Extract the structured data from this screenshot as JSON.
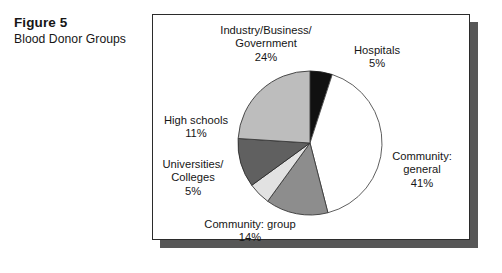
{
  "caption": {
    "figure_number": "Figure 5",
    "title": "Blood Donor Groups"
  },
  "chart_data": {
    "type": "pie",
    "title": "Blood Donor Groups",
    "units": "percent",
    "legend": "none-labels-on-slices",
    "start_angle_deg": 0,
    "direction": "clockwise",
    "categories": [
      "Hospitals",
      "Community: general",
      "Community: group",
      "Universities/Colleges",
      "High schools",
      "Industry/Business/Government"
    ],
    "values": [
      5,
      41,
      14,
      5,
      11,
      24
    ],
    "total": 100,
    "slices": [
      {
        "name": "Hospitals",
        "value": 5,
        "label_line1": "Hospitals",
        "label_line2": "5%",
        "color": "#111111",
        "stroke": "#1a1a1a"
      },
      {
        "name": "Community: general",
        "value": 41,
        "label_line1": "Community:",
        "label_line2": "general",
        "label_line3": "41%",
        "color": "#ffffff",
        "stroke": "#4d4d4d"
      },
      {
        "name": "Community: group",
        "value": 14,
        "label_line1": "Community: group",
        "label_line2": "14%",
        "color": "#8d8d8d",
        "stroke": "#3a3a3a"
      },
      {
        "name": "Universities/Colleges",
        "value": 5,
        "label_line1": "Universities/",
        "label_line2": "Colleges",
        "label_line3": "5%",
        "color": "#e2e2e2",
        "stroke": "#3a3a3a"
      },
      {
        "name": "High schools",
        "value": 11,
        "label_line1": "High schools",
        "label_line2": "11%",
        "color": "#606060",
        "stroke": "#2b2b2b"
      },
      {
        "name": "Industry/Business/Government",
        "value": 24,
        "label_line1": "Industry/Business/",
        "label_line2": "Government",
        "label_line3": "24%",
        "color": "#bdbdbd",
        "stroke": "#3a3a3a"
      }
    ],
    "geometry": {
      "center_x": 310,
      "center_y": 143,
      "radius": 72
    }
  },
  "labels": {
    "industry": "Industry/Business/\nGovernment\n24%",
    "hospitals": "Hospitals\n5%",
    "community_general": "Community:\ngeneral\n41%",
    "high_schools": "High schools\n11%",
    "universities": "Universities/\nColleges\n5%",
    "community_group": "Community: group\n14%"
  },
  "colors": {
    "panel_border": "#2b2b2b",
    "panel_shadow": "#575757",
    "text": "#161616",
    "background": "#ffffff"
  }
}
